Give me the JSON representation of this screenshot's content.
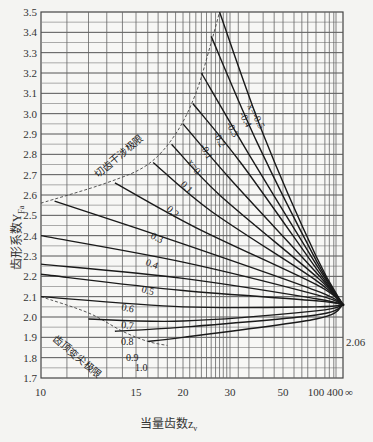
{
  "chart_data": {
    "type": "line",
    "title": "",
    "xlabel": "当量齿数z_v",
    "ylabel": "齿形系数Y_Fa",
    "ylim": [
      1.7,
      3.5
    ],
    "y_ticks": [
      "1.7",
      "1.8",
      "1.9",
      "2.0",
      "2.1",
      "2.2",
      "2.3",
      "2.4",
      "2.5",
      "2.6",
      "2.7",
      "2.8",
      "2.9",
      "3.0",
      "3.1",
      "3.2",
      "3.3",
      "3.4",
      "3.5"
    ],
    "x_ticks": [
      {
        "label": "10",
        "px": 41
      },
      {
        "label": "15",
        "px": 136
      },
      {
        "label": "20",
        "px": 183
      },
      {
        "label": "30",
        "px": 230
      },
      {
        "label": "50",
        "px": 283
      },
      {
        "label": "100",
        "px": 316
      },
      {
        "label": "400",
        "px": 335
      },
      {
        "label": "∞",
        "px": 349
      }
    ],
    "grid": true,
    "converge_point": {
      "z": "∞",
      "y": 2.06,
      "label": "2.06"
    },
    "boundaries": [
      {
        "name": "切齿干涉极限",
        "style": "dashed",
        "points": [
          [
            10,
            2.56
          ],
          [
            13,
            2.66
          ],
          [
            16,
            2.75
          ],
          [
            19,
            2.9
          ],
          [
            22,
            3.1
          ],
          [
            25,
            3.35
          ],
          [
            27,
            3.5
          ]
        ]
      },
      {
        "name": "齿顶变尖极限",
        "style": "dashed",
        "points": [
          [
            10,
            2.1
          ],
          [
            12,
            2.02
          ],
          [
            14,
            1.93
          ],
          [
            16,
            1.88
          ],
          [
            18,
            1.86
          ]
        ]
      }
    ],
    "series": [
      {
        "name": "x=-0.5",
        "label": "x=-0.5",
        "points": [
          [
            27,
            3.5
          ],
          [
            40,
            2.9
          ],
          [
            100,
            2.3
          ],
          [
            1000,
            2.06
          ]
        ]
      },
      {
        "name": "x=-0.4",
        "label": "-0.4",
        "points": [
          [
            25,
            3.38
          ],
          [
            38,
            2.85
          ],
          [
            100,
            2.28
          ],
          [
            1000,
            2.06
          ]
        ]
      },
      {
        "name": "x=-0.3",
        "label": "-0.3",
        "points": [
          [
            23,
            3.2
          ],
          [
            35,
            2.8
          ],
          [
            100,
            2.26
          ],
          [
            1000,
            2.06
          ]
        ]
      },
      {
        "name": "x=-0.2",
        "label": "-0.2",
        "points": [
          [
            21.5,
            3.05
          ],
          [
            33,
            2.75
          ],
          [
            100,
            2.24
          ],
          [
            1000,
            2.06
          ]
        ]
      },
      {
        "name": "x=-0.1",
        "label": "-0.1",
        "points": [
          [
            20,
            2.95
          ],
          [
            30,
            2.68
          ],
          [
            100,
            2.22
          ],
          [
            1000,
            2.06
          ]
        ]
      },
      {
        "name": "x=0",
        "label": "x=0",
        "points": [
          [
            18.5,
            2.85
          ],
          [
            27,
            2.6
          ],
          [
            100,
            2.2
          ],
          [
            1000,
            2.06
          ]
        ]
      },
      {
        "name": "x=0.1",
        "label": "0.1",
        "points": [
          [
            16.5,
            2.76
          ],
          [
            25,
            2.52
          ],
          [
            100,
            2.18
          ],
          [
            1000,
            2.06
          ]
        ]
      },
      {
        "name": "x=0.2",
        "label": "0.2",
        "points": [
          [
            13.5,
            2.66
          ],
          [
            22,
            2.44
          ],
          [
            100,
            2.16
          ],
          [
            1000,
            2.06
          ]
        ]
      },
      {
        "name": "x=0.3",
        "label": "0.3",
        "points": [
          [
            10.5,
            2.57
          ],
          [
            20,
            2.36
          ],
          [
            100,
            2.13
          ],
          [
            1000,
            2.06
          ]
        ]
      },
      {
        "name": "x=0.4",
        "label": "0.4",
        "points": [
          [
            10,
            2.4
          ],
          [
            20,
            2.27
          ],
          [
            100,
            2.11
          ],
          [
            1000,
            2.06
          ]
        ]
      },
      {
        "name": "x=0.5",
        "label": "0.5",
        "points": [
          [
            10,
            2.26
          ],
          [
            20,
            2.19
          ],
          [
            100,
            2.09
          ],
          [
            1000,
            2.06
          ]
        ]
      },
      {
        "name": "x=0.6",
        "label": "0.6",
        "points": [
          [
            10,
            2.21
          ],
          [
            20,
            2.13
          ],
          [
            100,
            2.08
          ],
          [
            1000,
            2.06
          ]
        ]
      },
      {
        "name": "x=0.7",
        "label": "0.7",
        "points": [
          [
            10,
            2.1
          ],
          [
            20,
            2.05
          ],
          [
            100,
            2.05
          ],
          [
            1000,
            2.06
          ]
        ]
      },
      {
        "name": "x=0.8",
        "label": "0.8",
        "points": [
          [
            12,
            1.99
          ],
          [
            20,
            1.98
          ],
          [
            100,
            2.03
          ],
          [
            1000,
            2.06
          ]
        ]
      },
      {
        "name": "x=0.9",
        "label": "0.9",
        "points": [
          [
            13.5,
            1.93
          ],
          [
            20,
            1.95
          ],
          [
            100,
            2.01
          ],
          [
            1000,
            2.06
          ]
        ]
      },
      {
        "name": "x=1.0",
        "label": "1.0",
        "points": [
          [
            16,
            1.88
          ],
          [
            20,
            1.9
          ],
          [
            100,
            1.99
          ],
          [
            1000,
            2.06
          ]
        ]
      }
    ]
  },
  "labels": {
    "ylabel": "齿形系数Y",
    "ylabel_sub": "Fa",
    "xlabel": "当量齿数z",
    "xlabel_sub": "v",
    "upper_boundary": "切齿干涉极限",
    "lower_boundary": "齿顶变尖极限",
    "converge": "2.06"
  }
}
